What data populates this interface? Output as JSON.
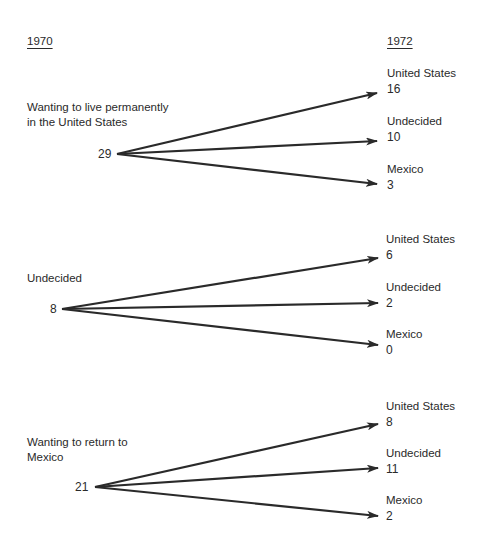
{
  "headers": {
    "left_year": "1970",
    "right_year": "1972"
  },
  "groups": [
    {
      "label_lines": [
        "Wanting to live permanently",
        "in the United States"
      ],
      "count": "29",
      "outcomes": [
        {
          "label": "United States",
          "value": "16"
        },
        {
          "label": "Undecided",
          "value": "10"
        },
        {
          "label": "Mexico",
          "value": "3"
        }
      ]
    },
    {
      "label_lines": [
        "Undecided"
      ],
      "count": "8",
      "outcomes": [
        {
          "label": "United States",
          "value": "6"
        },
        {
          "label": "Undecided",
          "value": "2"
        },
        {
          "label": "Mexico",
          "value": "0"
        }
      ]
    },
    {
      "label_lines": [
        "Wanting to return to",
        "Mexico"
      ],
      "count": "21",
      "outcomes": [
        {
          "label": "United States",
          "value": "8"
        },
        {
          "label": "Undecided",
          "value": "11"
        },
        {
          "label": "Mexico",
          "value": "2"
        }
      ]
    }
  ],
  "colors": {
    "ink": "#2a2a2a",
    "background": "#ffffff"
  }
}
